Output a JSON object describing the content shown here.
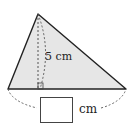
{
  "figure": {
    "type": "triangle",
    "height_label": "5 cm",
    "base_unit_label": "cm",
    "base_answer_box": "",
    "fill_color": "#e6e6e6",
    "stroke_color": "#222222"
  }
}
